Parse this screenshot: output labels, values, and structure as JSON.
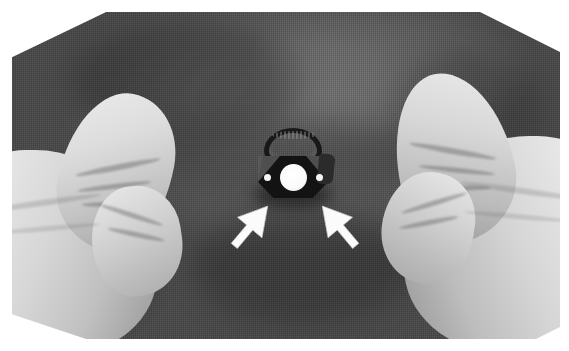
{
  "figure": {
    "kind": "photograph",
    "modality": "grayscale clinical photograph",
    "caption": "",
    "background_color": "#ffffff",
    "plate": {
      "left": 12,
      "top": 12,
      "width": 548,
      "height": 327,
      "border_color": "#ffffff"
    }
  },
  "scene": {
    "subject": "two gloved hands stretching a dark woven surgical mesh with a small black device at center",
    "drape": {
      "name": "surgical-drape",
      "material": "woven mesh fabric",
      "color": "#5a5a5a",
      "highlight_color": "#6d6d6d",
      "shadow_color": "#3f3f3f"
    },
    "hands": [
      {
        "name": "left-gloved-hand",
        "side": "left",
        "glove_color": "#d8d8d8",
        "glove_highlight": "#f2f2f2",
        "glove_shadow": "#8c8c8c",
        "parts": [
          "thumb",
          "knuckle",
          "palm"
        ]
      },
      {
        "name": "right-gloved-hand",
        "side": "right",
        "glove_color": "#d6d6d6",
        "glove_highlight": "#f2f2f2",
        "glove_shadow": "#8a8a8a",
        "parts": [
          "thumb",
          "knuckle",
          "palm"
        ]
      }
    ],
    "device": {
      "name": "central-device",
      "description": "black ring band above a dark cage body with a white circular aperture and two white marker dots",
      "body_color": "#131313",
      "band_color": "#191919",
      "lens_color": "#ffffff",
      "marker_dot_color": "#f4f4f4",
      "band_text": "",
      "markers": 2
    },
    "annotations": [
      {
        "name": "arrow-left",
        "type": "arrow",
        "color": "#ffffff",
        "points_to": "device lower-left anchor",
        "direction": "up-right",
        "label": ""
      },
      {
        "name": "arrow-right",
        "type": "arrow",
        "color": "#ffffff",
        "points_to": "device lower-right anchor",
        "direction": "up-left",
        "label": ""
      }
    ]
  },
  "text_overlays": []
}
